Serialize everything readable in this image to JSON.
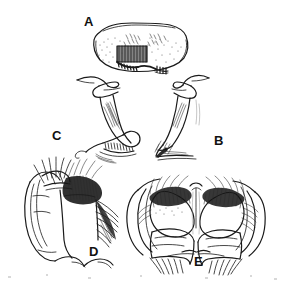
{
  "plate": {
    "title": "Taxonomic line-drawing plate of insect genitalic structures",
    "background_color": "#ffffff",
    "ink_color": "#1a1a1a",
    "width": 296,
    "height": 284,
    "technique": "pen-and-ink stipple and hatch line drawing",
    "panel_count": 5
  },
  "panels": [
    {
      "label": "A",
      "name": "panel-a",
      "description": "Broad rounded plate (sternite) with stippled surface, dark hatched rectangular patch at lower centre-left and a comb-like row of short teeth along the lower margin",
      "label_x": 84,
      "label_y": 15
    },
    {
      "label": "B",
      "name": "panel-b",
      "description": "Slender elongate appendage in lateral view with hooked apex, shaded basal lobe and fine setae at the tip, right-hand figure of the middle row",
      "label_x": 214,
      "label_y": 134
    },
    {
      "label": "C",
      "name": "panel-c",
      "description": "Slender elongate appendage in lateral view, mirror of B, with a serrate comb at the ventral apex, left-hand figure of the middle row",
      "label_x": 52,
      "label_y": 129
    },
    {
      "label": "D",
      "name": "panel-d",
      "description": "Lateral view of the terminalia showing dense brush of long setae along the dorsal margin and a fan of stiff bristles on the posterior face",
      "label_x": 89,
      "label_y": 245
    },
    {
      "label": "E",
      "name": "panel-e",
      "description": "Posterior (caudal) view of the terminalia, bilaterally symmetrical, with paired rounded surstyli bearing dense dorsal setal brushes and a median cleft",
      "label_x": 194,
      "label_y": 255
    }
  ],
  "labels": {
    "a": "A",
    "b": "B",
    "c": "C",
    "d": "D",
    "e": "E"
  },
  "colors": {
    "background": "#ffffff",
    "ink": "#1a1a1a",
    "shading": "#6e6e6e",
    "stipple": "#4a4a4a",
    "scan_artifact": "#d8d8d8"
  }
}
